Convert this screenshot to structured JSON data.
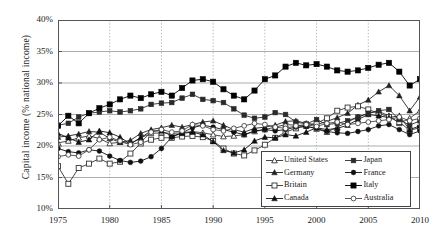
{
  "axes": {
    "ylabel": "Capital income (% national income)",
    "yticks": [
      "10%",
      "15%",
      "20%",
      "25%",
      "30%",
      "35%",
      "40%"
    ],
    "xticks": [
      "1975",
      "1980",
      "1985",
      "1990",
      "1995",
      "2000",
      "2005",
      "2010"
    ]
  },
  "legend": {
    "rows": [
      {
        "left": "United States",
        "right": "Japan"
      },
      {
        "left": "Germany",
        "right": "France"
      },
      {
        "left": "Britain",
        "right": "Italy"
      },
      {
        "left": "Canada",
        "right": "Australia"
      }
    ]
  },
  "chart_data": {
    "type": "line",
    "title": "",
    "xlabel": "",
    "ylabel": "Capital income (% national income)",
    "xlim": [
      1975,
      2010
    ],
    "ylim": [
      10,
      40
    ],
    "ygrid": true,
    "xgrid": true,
    "ytick_values": [
      10,
      15,
      20,
      25,
      30,
      35,
      40
    ],
    "xtick_values": [
      1975,
      1980,
      1985,
      1990,
      1995,
      2000,
      2005,
      2010
    ],
    "legend_position": "lower-right",
    "x": [
      1975,
      1976,
      1977,
      1978,
      1979,
      1980,
      1981,
      1982,
      1983,
      1984,
      1985,
      1986,
      1987,
      1988,
      1989,
      1990,
      1991,
      1992,
      1993,
      1994,
      1995,
      1996,
      1997,
      1998,
      1999,
      2000,
      2001,
      2002,
      2003,
      2004,
      2005,
      2006,
      2007,
      2008,
      2009,
      2010
    ],
    "series": [
      {
        "name": "United States",
        "marker": "open-triangle",
        "color": "#333333",
        "values": [
          20.5,
          20.8,
          21.3,
          21.6,
          21.2,
          20.4,
          20.6,
          20.4,
          21.3,
          22.0,
          22.1,
          22.0,
          22.1,
          22.3,
          22.1,
          21.8,
          21.5,
          21.6,
          21.8,
          22.3,
          22.6,
          23.0,
          23.4,
          23.3,
          23.2,
          22.7,
          22.2,
          23.0,
          23.8,
          24.6,
          25.2,
          25.5,
          24.8,
          23.6,
          24.4,
          25.6
        ]
      },
      {
        "name": "Germany",
        "marker": "filled-triangle",
        "color": "#222222",
        "values": [
          21.4,
          21.6,
          21.9,
          22.3,
          22.2,
          21.2,
          20.6,
          20.9,
          22.0,
          22.6,
          22.9,
          23.3,
          23.0,
          23.4,
          23.8,
          24.0,
          23.3,
          22.6,
          22.2,
          22.8,
          23.0,
          23.3,
          23.9,
          24.0,
          23.6,
          23.4,
          23.9,
          24.5,
          25.2,
          26.5,
          27.3,
          28.6,
          29.6,
          28.0,
          25.6,
          27.8
        ]
      },
      {
        "name": "Britain",
        "marker": "open-square",
        "color": "#333333",
        "values": [
          16.8,
          14.0,
          16.5,
          17.2,
          18.0,
          17.2,
          17.5,
          18.8,
          20.4,
          21.0,
          21.3,
          21.3,
          21.5,
          21.6,
          21.4,
          20.8,
          19.6,
          18.8,
          18.5,
          19.3,
          20.2,
          21.3,
          22.2,
          22.8,
          23.2,
          23.6,
          24.4,
          25.6,
          26.1,
          26.3,
          25.8,
          25.2,
          24.6,
          23.8,
          22.5,
          22.9
        ]
      },
      {
        "name": "Canada",
        "marker": "filled-triangle-2",
        "color": "#111111",
        "values": [
          22.0,
          21.3,
          20.6,
          21.0,
          22.4,
          22.1,
          21.4,
          20.3,
          21.3,
          22.4,
          22.4,
          21.6,
          22.0,
          22.2,
          21.8,
          20.7,
          19.3,
          18.9,
          19.4,
          20.8,
          21.4,
          21.3,
          21.8,
          21.6,
          22.2,
          22.9,
          22.6,
          22.8,
          23.3,
          24.2,
          25.0,
          24.8,
          24.5,
          24.8,
          22.6,
          23.2
        ]
      },
      {
        "name": "Japan",
        "marker": "filled-square-sm",
        "color": "#2a2a2a",
        "values": [
          23.3,
          23.6,
          24.6,
          25.2,
          25.4,
          25.6,
          25.4,
          25.6,
          25.9,
          26.6,
          26.8,
          26.9,
          27.6,
          28.2,
          27.4,
          27.2,
          26.9,
          25.9,
          24.9,
          24.4,
          24.6,
          25.3,
          25.0,
          23.8,
          23.5,
          24.2,
          23.4,
          23.6,
          24.0,
          24.6,
          25.2,
          25.6,
          25.8,
          24.2,
          23.3,
          24.0
        ]
      },
      {
        "name": "France",
        "marker": "filled-circle",
        "color": "#111111",
        "values": [
          19.6,
          19.1,
          18.9,
          19.4,
          19.2,
          18.4,
          17.7,
          17.4,
          17.6,
          18.3,
          19.6,
          21.4,
          22.1,
          22.9,
          23.3,
          23.0,
          22.6,
          22.2,
          21.8,
          22.4,
          22.6,
          22.4,
          22.6,
          23.0,
          23.1,
          22.8,
          22.3,
          22.1,
          22.0,
          22.3,
          22.6,
          23.2,
          23.4,
          22.6,
          21.8,
          22.4
        ]
      },
      {
        "name": "Italy",
        "marker": "filled-square",
        "color": "#000000",
        "values": [
          23.2,
          24.8,
          23.6,
          25.2,
          26.0,
          26.6,
          27.4,
          28.0,
          27.6,
          28.2,
          28.6,
          28.0,
          29.2,
          30.4,
          30.6,
          30.2,
          29.0,
          28.0,
          27.4,
          28.8,
          30.6,
          31.2,
          32.6,
          33.2,
          32.8,
          33.0,
          32.6,
          32.0,
          31.8,
          32.0,
          32.4,
          32.9,
          33.2,
          31.8,
          29.6,
          30.6
        ]
      },
      {
        "name": "Australia",
        "marker": "open-circle",
        "color": "#444444",
        "values": [
          18.3,
          18.6,
          18.4,
          19.4,
          21.0,
          21.4,
          20.8,
          20.2,
          20.6,
          22.2,
          22.6,
          22.2,
          22.4,
          23.4,
          23.2,
          22.6,
          22.4,
          22.8,
          23.2,
          23.6,
          23.4,
          23.0,
          22.8,
          23.2,
          23.4,
          23.1,
          23.6,
          23.8,
          23.4,
          23.6,
          23.8,
          24.0,
          24.2,
          24.6,
          24.0,
          24.4
        ]
      }
    ]
  }
}
